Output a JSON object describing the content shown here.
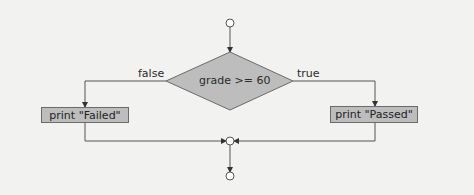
{
  "diagram": {
    "type": "flowchart",
    "title": "",
    "decision": {
      "label": "grade >= 60"
    },
    "branches": {
      "false": {
        "label": "false",
        "action": "print \"Failed\""
      },
      "true": {
        "label": "true",
        "action": "print \"Passed\""
      }
    },
    "nodes": [
      {
        "id": "start",
        "shape": "circle"
      },
      {
        "id": "decision",
        "shape": "diamond",
        "text": "grade >= 60"
      },
      {
        "id": "failed",
        "shape": "rectangle",
        "text": "print \"Failed\""
      },
      {
        "id": "passed",
        "shape": "rectangle",
        "text": "print \"Passed\""
      },
      {
        "id": "merge",
        "shape": "circle"
      },
      {
        "id": "end",
        "shape": "circle"
      }
    ],
    "edges": [
      {
        "from": "start",
        "to": "decision"
      },
      {
        "from": "decision",
        "to": "failed",
        "label": "false"
      },
      {
        "from": "decision",
        "to": "passed",
        "label": "true"
      },
      {
        "from": "failed",
        "to": "merge"
      },
      {
        "from": "passed",
        "to": "merge"
      },
      {
        "from": "merge",
        "to": "end"
      }
    ],
    "colors": {
      "fill": "#bdbdbd",
      "stroke": "#5a5a5a",
      "background": "#f2f2f0"
    }
  }
}
